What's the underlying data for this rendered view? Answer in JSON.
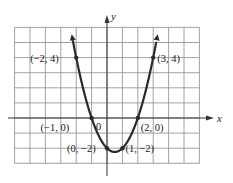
{
  "chart_data": {
    "type": "line",
    "title": "",
    "function": "y = x^2 - x - 2",
    "xlabel": "x",
    "ylabel": "y",
    "xlim": [
      -6,
      6
    ],
    "ylim": [
      -3,
      6
    ],
    "grid": true,
    "legend": null,
    "origin_label": "0",
    "points": [
      {
        "x": -2,
        "y": 4,
        "label": "(−2, 4)"
      },
      {
        "x": 3,
        "y": 4,
        "label": "(3, 4)"
      },
      {
        "x": -1,
        "y": 0,
        "label": "(−1, 0)"
      },
      {
        "x": 2,
        "y": 0,
        "label": "(2, 0)"
      },
      {
        "x": 0,
        "y": -2,
        "label": "(0, −2)"
      },
      {
        "x": 1,
        "y": -2,
        "label": "(1, −2)"
      }
    ],
    "series": [
      {
        "name": "parabola",
        "x": [
          -2.2,
          -2,
          -1,
          0,
          0.5,
          1,
          2,
          3,
          3.2
        ],
        "values": [
          4.64,
          4,
          0,
          -2,
          -2.25,
          -2,
          0,
          4,
          5.04
        ]
      }
    ],
    "colors": {
      "curve": "#2a2a2a",
      "grid": "#8a8a8a",
      "axis": "#333333"
    }
  }
}
